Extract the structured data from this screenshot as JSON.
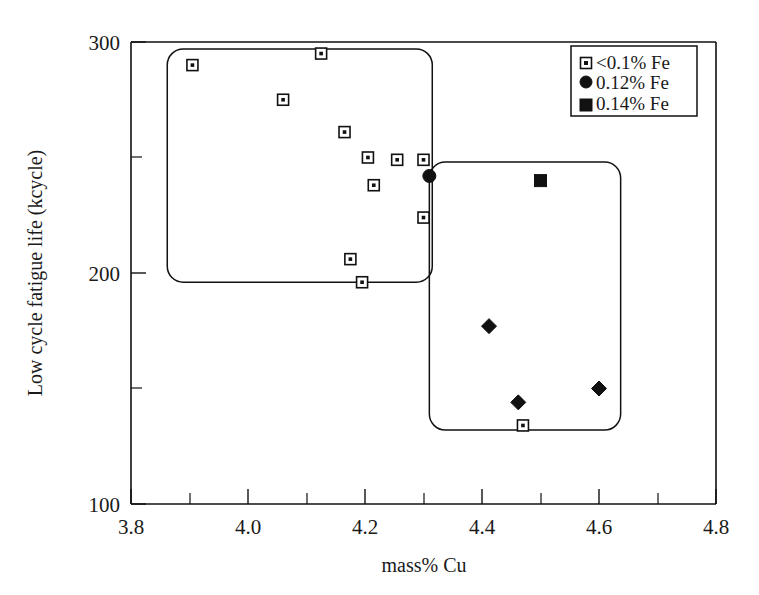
{
  "chart_data": {
    "type": "scatter",
    "title": "",
    "xlabel": "mass% Cu",
    "ylabel": "Low cycle fatigue life (kcycle)",
    "xlim": [
      3.8,
      4.8
    ],
    "ylim": [
      100,
      300
    ],
    "xticks": [
      3.8,
      4.0,
      4.2,
      4.4,
      4.6,
      4.8
    ],
    "xticklabels": [
      "3.8",
      "4.0",
      "4.2",
      "4.4",
      "4.6",
      "4.8"
    ],
    "xminorticks": [
      3.9,
      4.1,
      4.3,
      4.5,
      4.7
    ],
    "yticks": [
      100,
      200,
      300
    ],
    "yticklabels": [
      "100",
      "200",
      "300"
    ],
    "yminorticks": [
      150,
      250
    ],
    "grid": false,
    "legend_position": "top-right",
    "series": [
      {
        "name": "<0.1% Fe",
        "marker": "open-square-with-dot",
        "color": "#111111",
        "points": [
          {
            "x": 3.905,
            "y": 290
          },
          {
            "x": 4.06,
            "y": 275
          },
          {
            "x": 4.125,
            "y": 295
          },
          {
            "x": 4.165,
            "y": 261
          },
          {
            "x": 4.205,
            "y": 250
          },
          {
            "x": 4.215,
            "y": 238
          },
          {
            "x": 4.255,
            "y": 249
          },
          {
            "x": 4.3,
            "y": 249
          },
          {
            "x": 4.3,
            "y": 224
          },
          {
            "x": 4.175,
            "y": 206
          },
          {
            "x": 4.195,
            "y": 196
          },
          {
            "x": 4.47,
            "y": 134
          }
        ]
      },
      {
        "name": "0.12% Fe",
        "marker": "filled-circle",
        "color": "#111111",
        "points": [
          {
            "x": 4.31,
            "y": 242
          }
        ]
      },
      {
        "name": "0.14% Fe",
        "marker": "filled-square",
        "color": "#111111",
        "points": [
          {
            "x": 4.5,
            "y": 240
          }
        ]
      },
      {
        "name": "unlabelled-diamonds",
        "marker": "filled-diamond",
        "color": "#111111",
        "points": [
          {
            "x": 4.412,
            "y": 177
          },
          {
            "x": 4.462,
            "y": 144
          },
          {
            "x": 4.6,
            "y": 150
          }
        ]
      }
    ],
    "annotations": [
      {
        "kind": "rounded-rect-group",
        "label": "low-fe-group-box",
        "x_range": [
          3.862,
          4.315
        ],
        "y_range": [
          196,
          297
        ]
      },
      {
        "kind": "rounded-rect-group",
        "label": "high-fe-group-box",
        "x_range": [
          4.31,
          4.637
        ],
        "y_range": [
          132,
          248
        ]
      }
    ]
  },
  "legend": {
    "entries": [
      {
        "marker": "open-square-with-dot",
        "label": "<0.1% Fe"
      },
      {
        "marker": "filled-circle",
        "label": "0.12% Fe"
      },
      {
        "marker": "filled-square",
        "label": "0.14% Fe"
      }
    ]
  },
  "axes": {
    "x_title": "mass% Cu",
    "y_title": "Low cycle fatigue life (kcycle)",
    "x_tick_labels": [
      "3.8",
      "4.0",
      "4.2",
      "4.4",
      "4.6",
      "4.8"
    ],
    "y_tick_labels": [
      "300",
      "200",
      "100"
    ]
  }
}
